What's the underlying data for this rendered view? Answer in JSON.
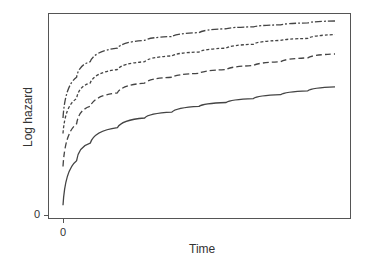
{
  "chart_data": {
    "type": "line",
    "title": "",
    "xlabel": "Time",
    "ylabel": "Log hazard",
    "x_ticks": [
      "0"
    ],
    "y_ticks": [
      "0"
    ],
    "grid": false,
    "legend": null,
    "x": [
      0,
      0.05,
      0.1,
      0.2,
      0.3,
      0.4,
      0.5,
      0.6,
      0.7,
      0.8,
      0.9,
      1.0
    ],
    "series": [
      {
        "name": "solid",
        "style": "solid",
        "values": [
          0.05,
          0.28,
          0.37,
          0.45,
          0.5,
          0.53,
          0.56,
          0.58,
          0.6,
          0.62,
          0.64,
          0.66
        ]
      },
      {
        "name": "dashed",
        "style": "dashed",
        "values": [
          0.25,
          0.47,
          0.56,
          0.63,
          0.68,
          0.71,
          0.73,
          0.75,
          0.77,
          0.79,
          0.81,
          0.83
        ]
      },
      {
        "name": "dotted",
        "style": "dotted",
        "values": [
          0.42,
          0.6,
          0.68,
          0.75,
          0.79,
          0.82,
          0.84,
          0.86,
          0.88,
          0.9,
          0.91,
          0.93
        ]
      },
      {
        "name": "dash-dot",
        "style": "dashdot",
        "values": [
          0.5,
          0.71,
          0.79,
          0.86,
          0.9,
          0.92,
          0.94,
          0.96,
          0.97,
          0.98,
          0.99,
          1.0
        ]
      }
    ]
  }
}
